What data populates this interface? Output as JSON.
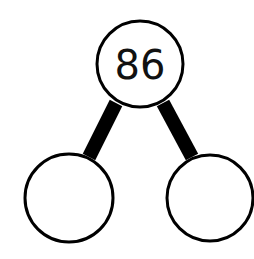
{
  "diagram": {
    "type": "number-bond",
    "whole": {
      "label": "86"
    },
    "parts": [
      {
        "label": ""
      },
      {
        "label": ""
      }
    ],
    "colors": {
      "stroke": "#000000",
      "fill": "#ffffff",
      "text": "#111111"
    }
  }
}
